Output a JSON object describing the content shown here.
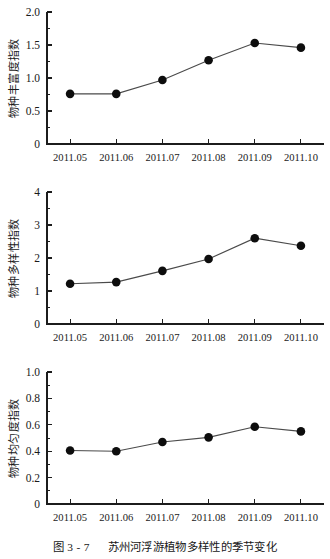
{
  "caption": {
    "number": "图 3 - 7",
    "text": "苏州河浮游植物多样性的季节变化"
  },
  "axis": {
    "x_categories": [
      "2011.05",
      "2011.06",
      "2011.07",
      "2011.08",
      "2011.09",
      "2011.10"
    ]
  },
  "chart_data": [
    {
      "type": "line",
      "title": "",
      "panel_index": 1,
      "xlabel": "",
      "ylabel": "物种丰富度指数",
      "categories": [
        "2011.05",
        "2011.06",
        "2011.07",
        "2011.08",
        "2011.09",
        "2011.10"
      ],
      "values": [
        0.76,
        0.76,
        0.97,
        1.27,
        1.53,
        1.46
      ],
      "ylim": [
        0,
        2.0
      ],
      "ytick_labels": [
        "0",
        "0.5",
        "1.0",
        "1.5",
        "2.0"
      ],
      "ytick_values": [
        0,
        0.5,
        1.0,
        1.5,
        2.0
      ],
      "yminor_step": 0.25,
      "grid": false,
      "legend": "none",
      "marker": "filled-circle",
      "marker_color": "#0d0d0d",
      "line_color": "#4a4a4a"
    },
    {
      "type": "line",
      "title": "",
      "panel_index": 2,
      "xlabel": "",
      "ylabel": "物种多样性指数",
      "categories": [
        "2011.05",
        "2011.06",
        "2011.07",
        "2011.08",
        "2011.09",
        "2011.10"
      ],
      "values": [
        1.22,
        1.27,
        1.61,
        1.97,
        2.6,
        2.37
      ],
      "ylim": [
        0,
        4
      ],
      "ytick_labels": [
        "0",
        "1",
        "2",
        "3",
        "4"
      ],
      "ytick_values": [
        0,
        1,
        2,
        3,
        4
      ],
      "yminor_step": 0.5,
      "grid": false,
      "legend": "none",
      "marker": "filled-circle",
      "marker_color": "#0d0d0d",
      "line_color": "#4a4a4a"
    },
    {
      "type": "line",
      "title": "",
      "panel_index": 3,
      "xlabel": "",
      "ylabel": "物种均匀度指数",
      "categories": [
        "2011.05",
        "2011.06",
        "2011.07",
        "2011.08",
        "2011.09",
        "2011.10"
      ],
      "values": [
        0.405,
        0.4,
        0.47,
        0.505,
        0.585,
        0.55
      ],
      "ylim": [
        0,
        1.0
      ],
      "ytick_labels": [
        "0",
        "0.2",
        "0.4",
        "0.6",
        "0.8",
        "1.0"
      ],
      "ytick_values": [
        0,
        0.2,
        0.4,
        0.6,
        0.8,
        1.0
      ],
      "yminor_step": 0.1,
      "grid": false,
      "legend": "none",
      "marker": "filled-circle",
      "marker_color": "#0d0d0d",
      "line_color": "#4a4a4a"
    }
  ]
}
